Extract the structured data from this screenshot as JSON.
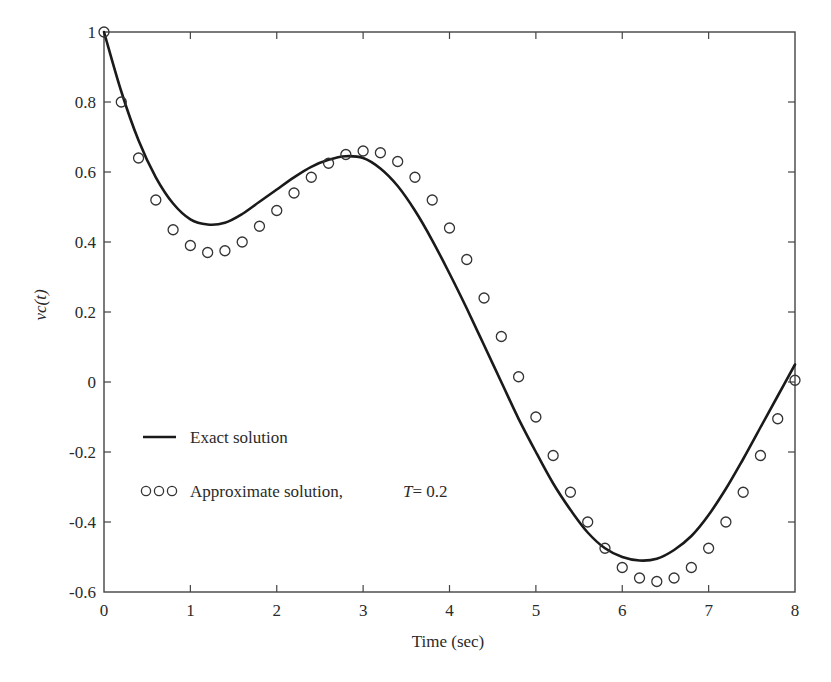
{
  "chart_data": {
    "type": "line",
    "title": "",
    "xlabel": "Time (sec)",
    "ylabel": "vc(t)",
    "xlim": [
      0,
      8
    ],
    "ylim": [
      -0.6,
      1
    ],
    "grid": false,
    "x_ticks": [
      0,
      1,
      2,
      3,
      4,
      5,
      6,
      7,
      8
    ],
    "x_tick_labels": [
      "0",
      "1",
      "2",
      "3",
      "4",
      "5",
      "6",
      "7",
      "8"
    ],
    "y_ticks": [
      1,
      0.8,
      0.6,
      0.4,
      0.2,
      0,
      -0.2,
      -0.4,
      -0.6
    ],
    "y_tick_labels": [
      "1",
      "0.8",
      "0.6",
      "0.4",
      "0.2",
      "0",
      "-0.2",
      "-0.4",
      "-0.6"
    ],
    "legend_position": "lower-left inside",
    "series": [
      {
        "name": "Exact solution",
        "style": "solid-line",
        "x": [
          0,
          0.2,
          0.4,
          0.6,
          0.8,
          1.0,
          1.2,
          1.4,
          1.6,
          1.8,
          2.0,
          2.2,
          2.4,
          2.6,
          2.8,
          3.0,
          3.2,
          3.4,
          3.6,
          3.8,
          4.0,
          4.2,
          4.4,
          4.6,
          4.8,
          5.0,
          5.2,
          5.4,
          5.6,
          5.8,
          6.0,
          6.2,
          6.4,
          6.6,
          6.8,
          7.0,
          7.2,
          7.4,
          7.6,
          7.8,
          8.0
        ],
        "values": [
          1.0,
          0.83,
          0.69,
          0.585,
          0.51,
          0.465,
          0.45,
          0.455,
          0.48,
          0.515,
          0.55,
          0.585,
          0.615,
          0.635,
          0.645,
          0.64,
          0.61,
          0.56,
          0.49,
          0.405,
          0.31,
          0.21,
          0.105,
          0.0,
          -0.105,
          -0.2,
          -0.29,
          -0.365,
          -0.43,
          -0.475,
          -0.5,
          -0.51,
          -0.505,
          -0.48,
          -0.44,
          -0.38,
          -0.305,
          -0.22,
          -0.13,
          -0.04,
          0.05
        ]
      },
      {
        "name": "Approximate solution, T= 0.2",
        "style": "open-circles",
        "x": [
          0,
          0.2,
          0.4,
          0.6,
          0.8,
          1.0,
          1.2,
          1.4,
          1.6,
          1.8,
          2.0,
          2.2,
          2.4,
          2.6,
          2.8,
          3.0,
          3.2,
          3.4,
          3.6,
          3.8,
          4.0,
          4.2,
          4.4,
          4.6,
          4.8,
          5.0,
          5.2,
          5.4,
          5.6,
          5.8,
          6.0,
          6.2,
          6.4,
          6.6,
          6.8,
          7.0,
          7.2,
          7.4,
          7.6,
          7.8,
          8.0
        ],
        "values": [
          1.0,
          0.8,
          0.64,
          0.52,
          0.435,
          0.39,
          0.37,
          0.375,
          0.4,
          0.445,
          0.49,
          0.54,
          0.585,
          0.625,
          0.65,
          0.66,
          0.655,
          0.63,
          0.585,
          0.52,
          0.44,
          0.35,
          0.24,
          0.13,
          0.015,
          -0.1,
          -0.21,
          -0.315,
          -0.4,
          -0.475,
          -0.53,
          -0.56,
          -0.57,
          -0.56,
          -0.53,
          -0.475,
          -0.4,
          -0.315,
          -0.21,
          -0.105,
          0.005
        ]
      }
    ]
  },
  "legend": {
    "exact_label": "Exact solution",
    "approx_label": "Approximate solution,",
    "approx_param": "T= 0.2"
  },
  "axes": {
    "xlabel": "Time (sec)",
    "ylabel": "vc(t)"
  },
  "colors": {
    "line": "#1a1a1a",
    "axis": "#444444",
    "marker": "#333333",
    "background": "#ffffff"
  }
}
